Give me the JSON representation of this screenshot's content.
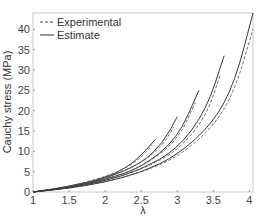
{
  "chart_data": {
    "type": "line",
    "title": "",
    "xlabel": "λ",
    "ylabel": "Cauchy stress (MPa)",
    "xlim": [
      1,
      4.05
    ],
    "ylim": [
      0,
      44
    ],
    "xticks": [
      "1",
      "1.5",
      "2",
      "2.5",
      "3",
      "3.5",
      "4"
    ],
    "yticks": [
      "0",
      "5",
      "10",
      "15",
      "20",
      "25",
      "30",
      "35",
      "40"
    ],
    "grid": false,
    "legend": {
      "position": "upper left",
      "entries": [
        "Experimental",
        "Estimate"
      ]
    },
    "series": [
      {
        "name": "Estimate 1",
        "style": "solid",
        "x": [
          1,
          1.5,
          2,
          2.3,
          2.5,
          2.7
        ],
        "y": [
          0,
          1.3,
          3.5,
          6,
          9,
          13
        ]
      },
      {
        "name": "Experimental 1",
        "style": "dashed",
        "x": [
          1,
          1.5,
          2,
          2.3,
          2.5,
          2.65
        ],
        "y": [
          0,
          1.4,
          3.7,
          6,
          8.5,
          11.5
        ]
      },
      {
        "name": "Estimate 2",
        "style": "solid",
        "x": [
          1,
          1.5,
          2,
          2.5,
          2.8,
          3.0
        ],
        "y": [
          0,
          1.2,
          3.2,
          7,
          12,
          18.5
        ]
      },
      {
        "name": "Experimental 2",
        "style": "dashed",
        "x": [
          1,
          1.5,
          2,
          2.5,
          2.8,
          2.95
        ],
        "y": [
          0,
          1.3,
          3.4,
          7,
          11.5,
          16
        ]
      },
      {
        "name": "Estimate 3",
        "style": "solid",
        "x": [
          1,
          1.5,
          2,
          2.5,
          3.0,
          3.3
        ],
        "y": [
          0,
          1.1,
          3.0,
          6,
          13,
          25
        ]
      },
      {
        "name": "Experimental 3",
        "style": "dashed",
        "x": [
          1,
          1.5,
          2,
          2.5,
          3.0,
          3.25
        ],
        "y": [
          0,
          1.2,
          3.1,
          6,
          12.5,
          22
        ]
      },
      {
        "name": "Estimate 4",
        "style": "solid",
        "x": [
          1,
          1.5,
          2,
          2.5,
          3.0,
          3.4,
          3.65
        ],
        "y": [
          0,
          1.0,
          2.7,
          5.5,
          10.5,
          20,
          33.5
        ]
      },
      {
        "name": "Experimental 4",
        "style": "dashed",
        "x": [
          1,
          1.5,
          2,
          2.5,
          3.0,
          3.4,
          3.6
        ],
        "y": [
          0,
          1.1,
          2.8,
          5.5,
          10,
          18.5,
          29
        ]
      },
      {
        "name": "Estimate 5",
        "style": "solid",
        "x": [
          1,
          1.5,
          2,
          2.5,
          3.0,
          3.5,
          3.8,
          4.05
        ],
        "y": [
          0,
          0.9,
          2.4,
          4.8,
          9,
          17,
          27,
          44
        ]
      },
      {
        "name": "Experimental 5",
        "style": "dashed",
        "x": [
          1,
          1.5,
          2,
          2.5,
          3.0,
          3.5,
          3.8,
          4.05
        ],
        "y": [
          0,
          1.0,
          2.5,
          4.8,
          8.5,
          16,
          25,
          40
        ]
      }
    ]
  },
  "legend": {
    "experimental": "Experimental",
    "estimate": "Estimate"
  },
  "axes": {
    "xlabel": "λ",
    "ylabel": "Cauchy stress (MPa)"
  }
}
